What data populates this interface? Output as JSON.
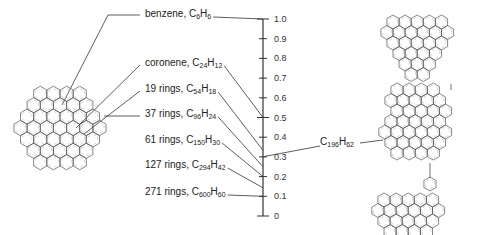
{
  "axis": {
    "ticks": [
      "1.0",
      "0.9",
      "0.8",
      "0.7",
      "0.6",
      "0.5",
      "0.4",
      "0.3",
      "0.2",
      "0.1",
      "0"
    ],
    "min": 0,
    "max": 1.0
  },
  "compounds": [
    {
      "name": "benzene",
      "c": "6",
      "h": "6",
      "ratio": 1.0
    },
    {
      "name": "coronene",
      "c": "24",
      "h": "12",
      "ratio": 0.5
    },
    {
      "name": "19 rings",
      "c": "54",
      "h": "18",
      "ratio": 0.333
    },
    {
      "name": "37 rings",
      "c": "96",
      "h": "24",
      "ratio": 0.25
    },
    {
      "name": "61 rings",
      "c": "150",
      "h": "30",
      "ratio": 0.2
    },
    {
      "name": "127 rings",
      "c": "294",
      "h": "42",
      "ratio": 0.143
    },
    {
      "name": "271 rings",
      "c": "600",
      "h": "60",
      "ratio": 0.1
    }
  ],
  "right_compound": {
    "c": "196",
    "h": "62",
    "ratio": 0.316
  },
  "chart_data": {
    "type": "table",
    "ylabel": "H/C ratio",
    "ylim": [
      0,
      1.0
    ],
    "categories": [
      "benzene C6H6",
      "coronene C24H12",
      "19 rings C54H18",
      "37 rings C96H24",
      "61 rings C150H30",
      "127 rings C294H42",
      "271 rings C600H60",
      "C196H62"
    ],
    "values": [
      1.0,
      0.5,
      0.333,
      0.25,
      0.2,
      0.143,
      0.1,
      0.316
    ]
  }
}
